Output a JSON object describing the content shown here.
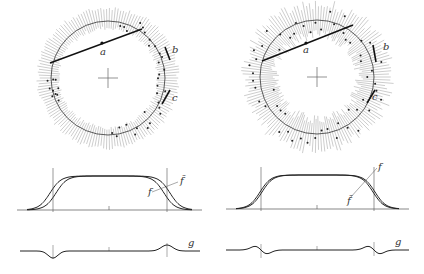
{
  "figure": {
    "width": 424,
    "height": 274,
    "colors": {
      "ink": "#222222",
      "tick": "#9a9a9a",
      "axis": "#555555",
      "background": "#ffffff"
    },
    "panels": [
      {
        "id": "left",
        "circle": {
          "cx": 108,
          "cy": 78,
          "r": 57,
          "tick_inner": 50,
          "tick_outer": 70,
          "tick_count": 150,
          "labels": {
            "a": "a",
            "b": "b",
            "c": "c"
          },
          "chord_a": {
            "x1": 50,
            "y1": 63,
            "x2": 142,
            "y2": 29,
            "mark_x": 102,
            "mark_y": 43,
            "label_x": 100,
            "label_y": 55
          },
          "segment_b": {
            "x1": 165,
            "y1": 47,
            "x2": 170,
            "y2": 60,
            "label_x": 172,
            "label_y": 53
          },
          "segment_c": {
            "x1": 170,
            "y1": 90,
            "x2": 162,
            "y2": 104,
            "label_x": 172,
            "label_y": 101
          }
        },
        "profile": {
          "x0": 17,
          "x1": 202,
          "baseline": 210,
          "plateau": 176,
          "edge_left": 53,
          "edge_right": 167,
          "center": 109,
          "label_f": "f",
          "label_ft": "f̃",
          "label_f_pos": [
            148,
            195
          ],
          "label_ft_pos": [
            180,
            184
          ]
        },
        "diff": {
          "x0": 20,
          "x1": 200,
          "baseline": 251,
          "label_g": "g",
          "label_g_pos": [
            188,
            246
          ],
          "features": [
            {
              "x": 53,
              "amp": 7,
              "width": 14
            },
            {
              "x": 167,
              "amp": -6,
              "width": 14
            }
          ]
        }
      },
      {
        "id": "right",
        "circle": {
          "cx": 317,
          "cy": 77,
          "r": 57,
          "tick_inner": 42,
          "tick_outer": 73,
          "tick_count": 150,
          "labels": {
            "a": "a",
            "b": "b",
            "c": "c"
          },
          "chord_a": {
            "x1": 262,
            "y1": 61,
            "x2": 353,
            "y2": 25,
            "mark_x": 306,
            "mark_y": 43,
            "label_x": 303,
            "label_y": 53
          },
          "segment_b": {
            "x1": 373,
            "y1": 45,
            "x2": 376,
            "y2": 62,
            "label_x": 383,
            "label_y": 50
          },
          "segment_c": {
            "x1": 375,
            "y1": 90,
            "x2": 367,
            "y2": 103,
            "label_x": 372,
            "label_y": 100
          }
        },
        "profile": {
          "x0": 226,
          "x1": 409,
          "baseline": 209,
          "plateau": 175,
          "edge_left": 261,
          "edge_right": 374,
          "center": 317,
          "label_f": "f",
          "label_ft": "f̃",
          "label_f_pos": [
            378,
            170
          ],
          "label_ft_pos": [
            347,
            204
          ]
        },
        "diff": {
          "x0": 226,
          "x1": 409,
          "baseline": 250,
          "label_g": "g",
          "label_g_pos": [
            395,
            245
          ],
          "features": [
            {
              "x": 261,
              "amp": 0,
              "width": 0,
              "oscillate": true
            },
            {
              "x": 374,
              "amp": 0,
              "width": 0,
              "oscillate": true
            }
          ]
        }
      }
    ]
  }
}
